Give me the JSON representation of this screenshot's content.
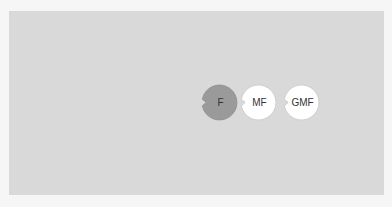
{
  "canvas": {
    "background": "#f6f6f6",
    "panel_color": "#d9d9d9"
  },
  "nodes": [
    {
      "label": "F",
      "fill": "#9a9a9a",
      "stroke": "#8f8f8f",
      "icon": "pacman-circle-icon"
    },
    {
      "label": "MF",
      "fill": "#ffffff",
      "stroke": "#c8c8c8",
      "icon": "pacman-circle-icon"
    },
    {
      "label": "GMF",
      "fill": "#ffffff",
      "stroke": "#c8c8c8",
      "icon": "pacman-circle-icon"
    }
  ]
}
